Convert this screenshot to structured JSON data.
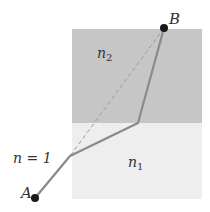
{
  "diagram": {
    "type": "refraction-path",
    "regions": [
      {
        "id": "medium-n2",
        "label": "n",
        "subscript": "2",
        "color": "#c8c8c8"
      },
      {
        "id": "medium-n1",
        "label": "n",
        "subscript": "1",
        "color": "#eeeeee"
      },
      {
        "id": "medium-n",
        "label": "n = 1",
        "color": "#ffffff"
      }
    ],
    "points": [
      {
        "id": "A",
        "label": "A"
      },
      {
        "id": "B",
        "label": "B"
      }
    ],
    "labels": {
      "a": "A",
      "b": "B",
      "n2_base": "n",
      "n2_sub": "2",
      "n1_base": "n",
      "n1_sub": "1",
      "n_eq": "n = 1"
    },
    "colors": {
      "path": "#8a8a8a",
      "dashed": "#999999",
      "point": "#1a1a1a"
    }
  }
}
